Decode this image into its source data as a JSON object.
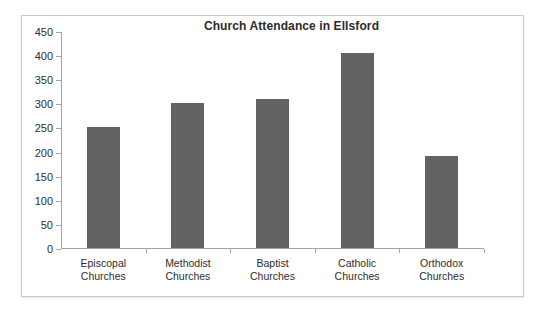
{
  "chart_data": {
    "type": "bar",
    "title": "Church Attendance in Ellsford",
    "xlabel": "",
    "ylabel": "",
    "ylim": [
      0,
      450
    ],
    "ytick_step": 50,
    "grid": false,
    "legend": "none",
    "bar_color": "#636363",
    "categories": [
      "Episcopal Churches",
      "Methodist Churches",
      "Baptist Churches",
      "Catholic Churches",
      "Orthodox Churches"
    ],
    "category_lines": [
      [
        "Episcopal",
        "Churches"
      ],
      [
        "Methodist",
        "Churches"
      ],
      [
        "Baptist",
        "Churches"
      ],
      [
        "Catholic",
        "Churches"
      ],
      [
        "Orthodox",
        "Churches"
      ]
    ],
    "values": [
      250,
      300,
      310,
      405,
      190
    ],
    "ytick_labels": [
      "450",
      "400",
      "350",
      "300",
      "250",
      "200",
      "150",
      "100",
      "50",
      "0"
    ],
    "ytick_values": [
      450,
      400,
      350,
      300,
      250,
      200,
      150,
      100,
      50,
      0
    ]
  }
}
